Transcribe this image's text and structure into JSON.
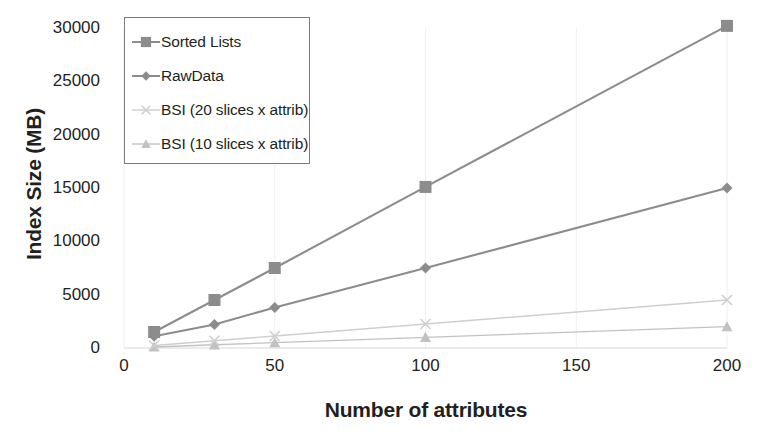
{
  "chart_data": {
    "type": "line",
    "title": "",
    "xlabel": "Number of attributes",
    "ylabel": "Index Size (MB)",
    "x": [
      10,
      30,
      50,
      100,
      200
    ],
    "xlim": [
      0,
      200
    ],
    "ylim": [
      0,
      30000
    ],
    "xticks": [
      "0",
      "50",
      "100",
      "150",
      "200"
    ],
    "xtick_values": [
      0,
      50,
      100,
      150,
      200
    ],
    "yticks": [
      "0",
      "5000",
      "10000",
      "15000",
      "20000",
      "25000",
      "30000"
    ],
    "ytick_values": [
      0,
      5000,
      10000,
      15000,
      20000,
      25000,
      30000
    ],
    "grid": false,
    "legend_position": "upper-left",
    "series": [
      {
        "name": "Sorted Lists",
        "marker": "square",
        "color": "#8c8c8c",
        "values": [
          1500,
          4500,
          7500,
          15100,
          30200
        ]
      },
      {
        "name": "RawData",
        "marker": "diamond",
        "color": "#8c8c8c",
        "values": [
          1100,
          2200,
          3800,
          7500,
          15000
        ]
      },
      {
        "name": "BSI (20 slices x attrib)",
        "marker": "x",
        "color": "#cfcfcf",
        "values": [
          230,
          680,
          1130,
          2250,
          4500
        ]
      },
      {
        "name": "BSI (10 slices x attrib)",
        "marker": "triangle",
        "color": "#c2c2c2",
        "values": [
          100,
          300,
          500,
          1000,
          2000
        ]
      }
    ]
  }
}
